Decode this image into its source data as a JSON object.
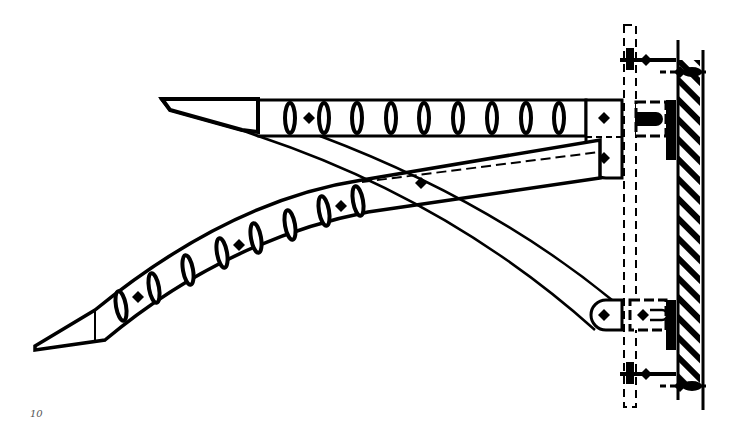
{
  "figure": {
    "type": "technical-drawing",
    "page_number": "10",
    "colors": {
      "line": "#000000",
      "background": "#ffffff",
      "hatch": "#000000",
      "page_number": "#555555"
    },
    "upper_arm": {
      "slot_count": 9,
      "bolt_markers": 1
    },
    "lower_arm": {
      "slot_count": 9,
      "bolt_markers": 3
    },
    "wall": {
      "hatched": true
    }
  }
}
